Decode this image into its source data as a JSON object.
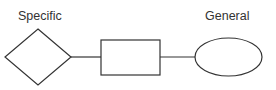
{
  "canvas": {
    "width": 276,
    "height": 90,
    "background": "#ffffff",
    "stroke_color": "#333333",
    "text_color": "#333333"
  },
  "labels": {
    "left": "Specific",
    "right": "General"
  },
  "nodes": [
    {
      "id": "diamond",
      "shape": "diamond",
      "label": "",
      "cx": 38,
      "cy": 57,
      "rx": 33,
      "ry": 28
    },
    {
      "id": "rectangle",
      "shape": "rectangle",
      "label": "",
      "x": 101,
      "y": 40,
      "width": 59,
      "height": 35
    },
    {
      "id": "ellipse",
      "shape": "ellipse",
      "label": "",
      "cx": 228.5,
      "cy": 57,
      "rx": 33.5,
      "ry": 19
    }
  ],
  "connectors": [
    {
      "id": "diamond-to-rectangle",
      "x1": 71,
      "y1": 57,
      "x2": 101,
      "y2": 57
    },
    {
      "id": "rectangle-to-ellipse",
      "x1": 160,
      "y1": 57,
      "x2": 195,
      "y2": 57
    }
  ]
}
